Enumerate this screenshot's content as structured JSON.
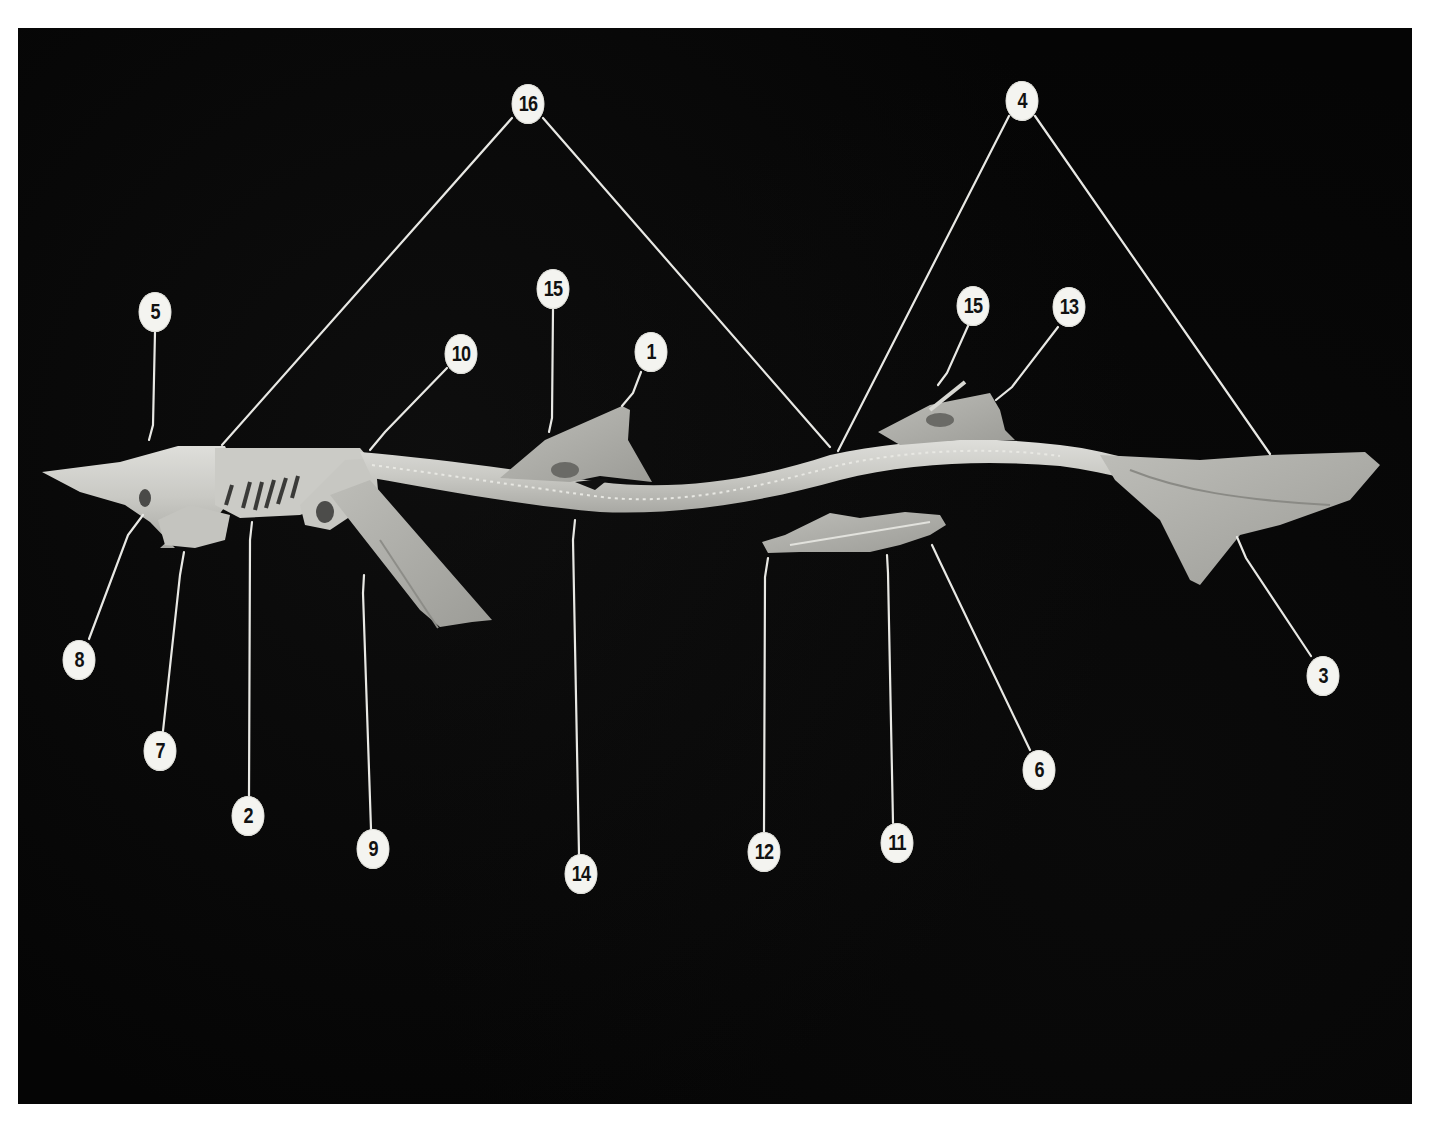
{
  "figure": {
    "background_color": "#050505",
    "specimen_color": "#cfcfca",
    "leader_line_color": "#e8e8e4",
    "callout_fill": "#f4f4f0",
    "callout_text_color": "#111111"
  },
  "callouts": [
    {
      "id": "c16",
      "label": "16",
      "x": 528,
      "y": 104
    },
    {
      "id": "c4",
      "label": "4",
      "x": 1022,
      "y": 101
    },
    {
      "id": "c5",
      "label": "5",
      "x": 155,
      "y": 312
    },
    {
      "id": "c10",
      "label": "10",
      "x": 461,
      "y": 354
    },
    {
      "id": "c15a",
      "label": "15",
      "x": 553,
      "y": 289
    },
    {
      "id": "c1",
      "label": "1",
      "x": 651,
      "y": 352
    },
    {
      "id": "c15b",
      "label": "15",
      "x": 973,
      "y": 306
    },
    {
      "id": "c13",
      "label": "13",
      "x": 1069,
      "y": 307
    },
    {
      "id": "c8",
      "label": "8",
      "x": 79,
      "y": 660
    },
    {
      "id": "c7",
      "label": "7",
      "x": 160,
      "y": 751
    },
    {
      "id": "c2",
      "label": "2",
      "x": 248,
      "y": 816
    },
    {
      "id": "c9",
      "label": "9",
      "x": 373,
      "y": 849
    },
    {
      "id": "c14",
      "label": "14",
      "x": 581,
      "y": 874
    },
    {
      "id": "c12",
      "label": "12",
      "x": 764,
      "y": 852
    },
    {
      "id": "c11",
      "label": "11",
      "x": 897,
      "y": 843
    },
    {
      "id": "c6",
      "label": "6",
      "x": 1039,
      "y": 770
    },
    {
      "id": "c3",
      "label": "3",
      "x": 1323,
      "y": 676
    }
  ],
  "leader_lines": [
    {
      "from": "16",
      "points": [
        [
          512,
          118
        ],
        [
          222,
          445
        ]
      ]
    },
    {
      "from": "16",
      "points": [
        [
          543,
          118
        ],
        [
          830,
          447
        ]
      ]
    },
    {
      "from": "4",
      "points": [
        [
          1009,
          116
        ],
        [
          838,
          451
        ]
      ]
    },
    {
      "from": "4",
      "points": [
        [
          1035,
          116
        ],
        [
          1270,
          454
        ]
      ]
    },
    {
      "from": "5",
      "points": [
        [
          155,
          332
        ],
        [
          153,
          425
        ],
        [
          149,
          440
        ]
      ]
    },
    {
      "from": "10",
      "points": [
        [
          447,
          368
        ],
        [
          385,
          432
        ],
        [
          370,
          450
        ]
      ]
    },
    {
      "from": "15",
      "points": [
        [
          553,
          309
        ],
        [
          552,
          418
        ],
        [
          549,
          432
        ]
      ]
    },
    {
      "from": "1",
      "points": [
        [
          641,
          372
        ],
        [
          633,
          393
        ],
        [
          622,
          406
        ]
      ]
    },
    {
      "from": "15",
      "points": [
        [
          968,
          326
        ],
        [
          947,
          373
        ],
        [
          938,
          385
        ]
      ]
    },
    {
      "from": "13",
      "points": [
        [
          1058,
          327
        ],
        [
          1012,
          387
        ],
        [
          996,
          400
        ]
      ]
    },
    {
      "from": "8",
      "points": [
        [
          89,
          639
        ],
        [
          128,
          535
        ],
        [
          143,
          515
        ]
      ]
    },
    {
      "from": "7",
      "points": [
        [
          163,
          731
        ],
        [
          180,
          575
        ],
        [
          184,
          552
        ]
      ]
    },
    {
      "from": "2",
      "points": [
        [
          249,
          796
        ],
        [
          250,
          540
        ],
        [
          252,
          522
        ]
      ]
    },
    {
      "from": "9",
      "points": [
        [
          371,
          829
        ],
        [
          363,
          593
        ],
        [
          364,
          575
        ]
      ]
    },
    {
      "from": "14",
      "points": [
        [
          579,
          854
        ],
        [
          573,
          540
        ],
        [
          575,
          520
        ]
      ]
    },
    {
      "from": "12",
      "points": [
        [
          764,
          832
        ],
        [
          765,
          577
        ],
        [
          768,
          558
        ]
      ]
    },
    {
      "from": "11",
      "points": [
        [
          893,
          823
        ],
        [
          888,
          573
        ],
        [
          887,
          555
        ]
      ]
    },
    {
      "from": "6",
      "points": [
        [
          1030,
          750
        ],
        [
          940,
          562
        ],
        [
          932,
          545
        ]
      ]
    },
    {
      "from": "3",
      "points": [
        [
          1311,
          656
        ],
        [
          1246,
          558
        ],
        [
          1237,
          537
        ]
      ]
    }
  ]
}
